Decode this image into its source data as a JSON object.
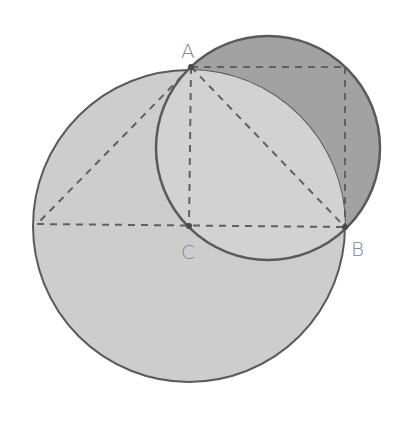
{
  "diagram": {
    "type": "geometry",
    "labels": {
      "A": "A",
      "B": "B",
      "C": "C"
    },
    "points": {
      "A": [
        191,
        67
      ],
      "B": [
        345,
        227
      ],
      "C": [
        189,
        226
      ],
      "D_left": [
        37,
        224
      ],
      "E_corner": [
        345,
        67
      ]
    },
    "circles": {
      "large": {
        "center": [
          189,
          226
        ],
        "r": 156,
        "fill": "#cdcdcd"
      },
      "small": {
        "center": [
          268,
          148
        ],
        "r": 112,
        "fill": "#a2a2a2"
      }
    },
    "colors": {
      "stroke": "#5a5a5a",
      "dash": "#606060",
      "label": "#8a8a8a",
      "lens_fill": "#d2d2d2"
    }
  }
}
